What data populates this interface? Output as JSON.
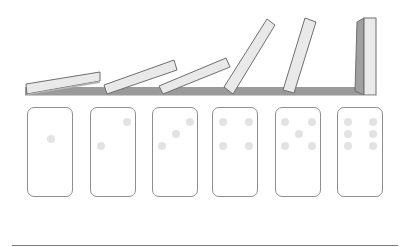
{
  "figure": {
    "colors": {
      "ground": "#9a9a9a",
      "domino_face": "#e9e9e9",
      "domino_side": "#a8a8a8",
      "domino_outline": "#6e6e6e",
      "card_border": "#8e8e8e",
      "pip": "#e3e3e3",
      "rule": "#7a7a7a"
    },
    "ground": {
      "x": 25,
      "y": 87,
      "width": 350,
      "height": 8
    },
    "dominoes": [
      {
        "index": 1,
        "state": "fallen",
        "angle": -9
      },
      {
        "index": 2,
        "state": "fallen",
        "angle": -20
      },
      {
        "index": 3,
        "state": "falling",
        "angle": -28
      },
      {
        "index": 4,
        "state": "falling",
        "angle": -58
      },
      {
        "index": 5,
        "state": "falling",
        "angle": -72
      },
      {
        "index": 6,
        "state": "standing",
        "angle": 0
      }
    ],
    "cards": [
      {
        "value": 1,
        "x": 27
      },
      {
        "value": 2,
        "x": 90
      },
      {
        "value": 3,
        "x": 152
      },
      {
        "value": 4,
        "x": 212
      },
      {
        "value": 5,
        "x": 275
      },
      {
        "value": 6,
        "x": 337
      }
    ]
  }
}
